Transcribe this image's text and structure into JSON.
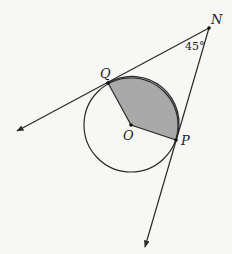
{
  "diagram": {
    "type": "circle-with-tangents",
    "colors": {
      "background": "#f7f7f5",
      "stroke": "#2a2a2a",
      "sector_fill": "#a9a9a9"
    },
    "circle": {
      "center_label": "O",
      "cx": 131,
      "cy": 125,
      "r": 47
    },
    "points": {
      "N": {
        "label": "N",
        "x": 209,
        "y": 28
      },
      "Q": {
        "label": "Q",
        "x": 108,
        "y": 83
      },
      "P": {
        "label": "P",
        "x": 176,
        "y": 140
      },
      "O": {
        "label": "O",
        "x": 131,
        "y": 125
      }
    },
    "angle_label": "45°",
    "shaded_region": "sector QOP (minor arc)",
    "rays": [
      {
        "from": "N",
        "through": "Q",
        "arrow_end": [
          17,
          131
        ]
      },
      {
        "from": "N",
        "through": "P",
        "arrow_end": [
          145,
          247
        ]
      }
    ]
  }
}
